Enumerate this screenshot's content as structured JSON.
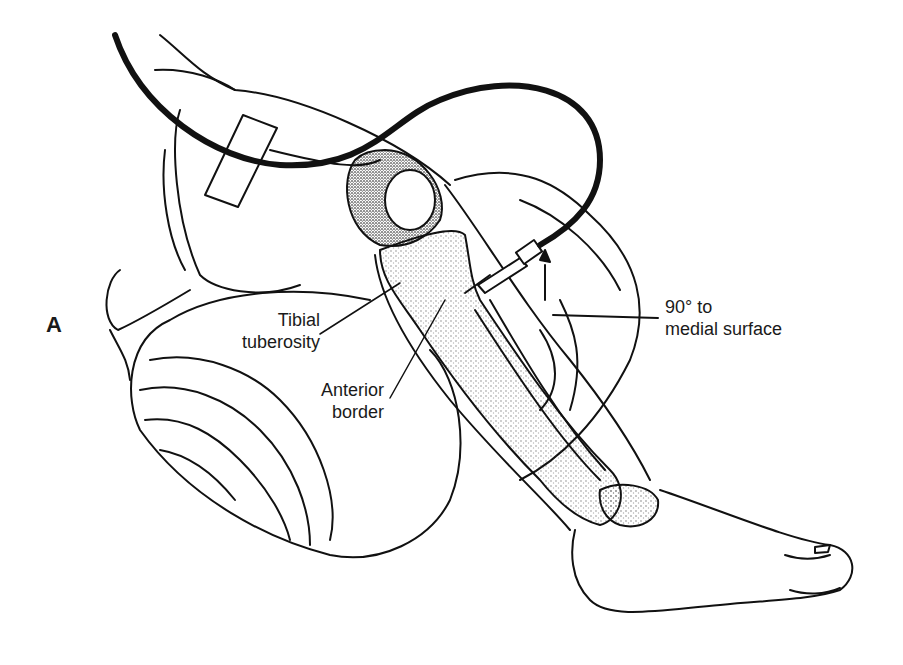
{
  "figure": {
    "panel_label": "A",
    "labels": {
      "tibial_tuberosity": [
        "Tibial",
        "tuberosity"
      ],
      "anterior_border": [
        "Anterior",
        "border"
      ],
      "angle": [
        "90° to",
        "medial surface"
      ]
    },
    "colors": {
      "ink": "#111111",
      "background": "#ffffff",
      "stipple": "#555555"
    }
  }
}
